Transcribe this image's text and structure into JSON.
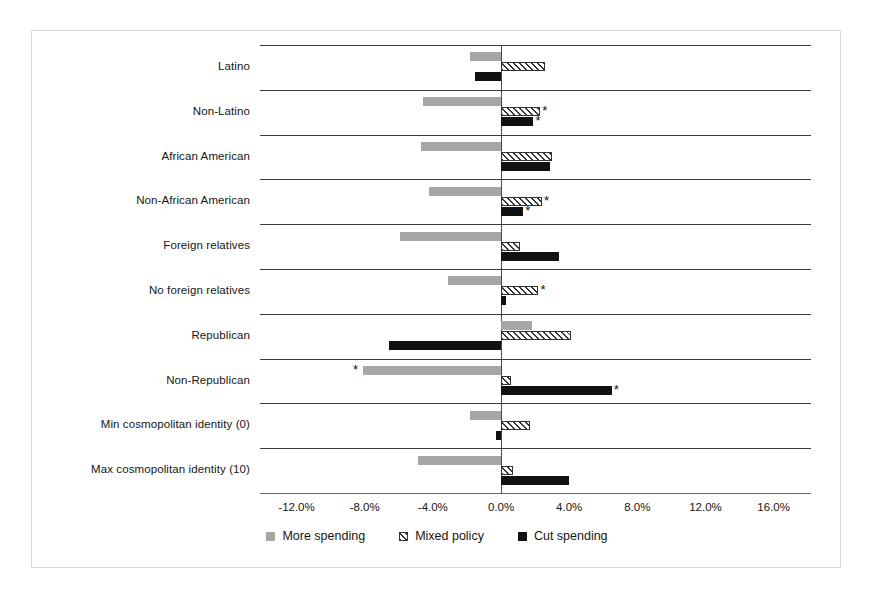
{
  "chart_data": {
    "type": "bar",
    "orientation": "horizontal",
    "title": "",
    "subtitle": "",
    "xlabel": "",
    "ylabel": "",
    "xlim": [
      -14.0,
      17.0
    ],
    "xticks": [
      "-12.0%",
      "-8.0%",
      "-4.0%",
      "0.0%",
      "4.0%",
      "8.0%",
      "12.0%",
      "16.0%"
    ],
    "xtick_values": [
      -12.0,
      -8.0,
      -4.0,
      0.0,
      4.0,
      8.0,
      12.0,
      16.0
    ],
    "grid": false,
    "rowlines": true,
    "zero_reference_line": true,
    "legend_position": "bottom-center",
    "categories": [
      "Latino",
      "Non-Latino",
      "African American",
      "Non-African American",
      "Foreign relatives",
      "No foreign relatives",
      "Republican",
      "Non-Republican",
      "Min cosmopolitan identity (0)",
      "Max cosmopolitan identity (10)"
    ],
    "series": [
      {
        "name": "More spending",
        "color": "#a6a6a6",
        "pattern": "solid",
        "values": [
          -1.8,
          -4.6,
          -4.7,
          -4.2,
          -5.9,
          -3.1,
          1.8,
          -8.1,
          -1.8,
          -4.9
        ],
        "significant": [
          false,
          false,
          false,
          false,
          false,
          false,
          false,
          true,
          false,
          false
        ]
      },
      {
        "name": "Mixed policy",
        "color": "#ffffff",
        "pattern": "diagonal-hatch",
        "values": [
          2.6,
          2.3,
          3.0,
          2.4,
          1.1,
          2.2,
          4.1,
          0.6,
          1.7,
          0.7
        ],
        "significant": [
          false,
          true,
          false,
          true,
          false,
          true,
          false,
          false,
          false,
          false
        ]
      },
      {
        "name": "Cut spending",
        "color": "#111111",
        "pattern": "solid",
        "values": [
          -1.5,
          1.9,
          2.9,
          1.3,
          3.4,
          0.3,
          -6.6,
          6.5,
          -0.3,
          4.0
        ],
        "significant": [
          false,
          true,
          false,
          true,
          false,
          false,
          false,
          true,
          false,
          false
        ]
      }
    ],
    "significance_marker": "*"
  },
  "legend": {
    "items": [
      {
        "label": "More spending",
        "swatch": "more"
      },
      {
        "label": "Mixed policy",
        "swatch": "mixed"
      },
      {
        "label": "Cut spending",
        "swatch": "cut"
      }
    ]
  }
}
